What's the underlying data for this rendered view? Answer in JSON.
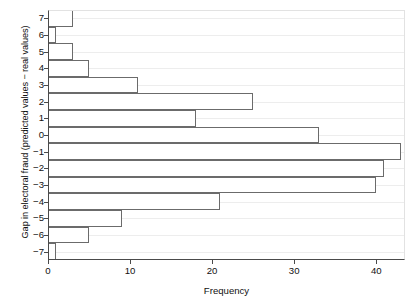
{
  "chart_data": {
    "type": "bar",
    "orientation": "horizontal",
    "title": "",
    "xlabel": "Frequency",
    "ylabel": "Gap in electoral fraud (predicted values − real values)",
    "xlim": [
      0,
      43.5
    ],
    "ylim": [
      -7.5,
      7.5
    ],
    "xticks": [
      0,
      10,
      20,
      30,
      40
    ],
    "xtick_labels": [
      "0",
      "10",
      "20",
      "30",
      "40"
    ],
    "yticks": [
      7,
      6,
      5,
      4,
      3,
      2,
      1,
      0,
      -1,
      -2,
      -3,
      -4,
      -5,
      -6,
      -7
    ],
    "ytick_labels": [
      "7",
      "6",
      "5",
      "4",
      "3",
      "2",
      "1",
      "0",
      "−1",
      "−2",
      "−3",
      "−4",
      "−5",
      "−6",
      "−7"
    ],
    "grid": true,
    "grid_axis": "y",
    "legend": null,
    "categories": [
      7,
      6,
      5,
      4,
      3,
      2,
      1,
      0,
      -1,
      -2,
      -3,
      -4,
      -5,
      -6,
      -7
    ],
    "values": [
      3,
      1,
      3,
      5,
      11,
      25,
      18,
      33,
      43,
      41,
      40,
      21,
      9,
      5,
      1
    ],
    "bars": [
      {
        "category": "7",
        "value": 3
      },
      {
        "category": "6",
        "value": 1
      },
      {
        "category": "5",
        "value": 3
      },
      {
        "category": "4",
        "value": 5
      },
      {
        "category": "3",
        "value": 11
      },
      {
        "category": "2",
        "value": 25
      },
      {
        "category": "1",
        "value": 18
      },
      {
        "category": "0",
        "value": 33
      },
      {
        "category": "−1",
        "value": 43
      },
      {
        "category": "−2",
        "value": 41
      },
      {
        "category": "−3",
        "value": 40
      },
      {
        "category": "−4",
        "value": 21
      },
      {
        "category": "−5",
        "value": 9
      },
      {
        "category": "−6",
        "value": 5
      },
      {
        "category": "−7",
        "value": 1
      }
    ],
    "colors": {
      "bar_fill": "#ffffff",
      "bar_edge": "#6b6b6b",
      "axis": "#4a4a4a",
      "grid": "#ededed",
      "text": "#111111",
      "background": "#ffffff"
    }
  }
}
